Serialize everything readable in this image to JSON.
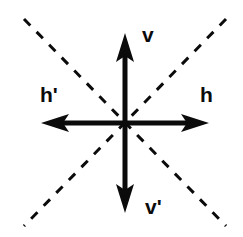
{
  "figure": {
    "background_color": "#ffffff",
    "stroke_color": "#0b0b0b",
    "width": 243,
    "height": 237,
    "center": {
      "x": 125,
      "y": 123
    }
  },
  "labels": {
    "up": "v",
    "down": "v'",
    "right": "h",
    "left": "h'"
  },
  "axes": [
    {
      "name": "vertical-up-axis",
      "label": "v",
      "direction": "up",
      "from": {
        "x": 125,
        "y": 123
      },
      "to": {
        "x": 125,
        "y": 35
      },
      "style": "solid",
      "arrowhead": true
    },
    {
      "name": "vertical-down-axis",
      "label": "v'",
      "direction": "down",
      "from": {
        "x": 125,
        "y": 123
      },
      "to": {
        "x": 125,
        "y": 211
      },
      "style": "solid",
      "arrowhead": true
    },
    {
      "name": "horizontal-right-axis",
      "label": "h",
      "direction": "right",
      "from": {
        "x": 125,
        "y": 123
      },
      "to": {
        "x": 208,
        "y": 123
      },
      "style": "solid",
      "arrowhead": true
    },
    {
      "name": "horizontal-left-axis",
      "label": "h'",
      "direction": "left",
      "from": {
        "x": 125,
        "y": 123
      },
      "to": {
        "x": 42,
        "y": 123
      },
      "style": "solid",
      "arrowhead": true
    }
  ],
  "diagonals": [
    {
      "name": "diagonal-nw-se",
      "from": {
        "x": 24,
        "y": 19
      },
      "to": {
        "x": 226,
        "y": 226
      },
      "style": "dashed",
      "dash": "9 9",
      "arrowhead": false
    },
    {
      "name": "diagonal-ne-sw",
      "from": {
        "x": 226,
        "y": 19
      },
      "to": {
        "x": 24,
        "y": 226
      },
      "style": "dashed",
      "dash": "9 9",
      "arrowhead": false
    }
  ],
  "geometry": {
    "axis_stroke_width": 5,
    "diagonal_stroke_width": 3,
    "arrow_half_width": 9,
    "arrow_length": 22
  }
}
